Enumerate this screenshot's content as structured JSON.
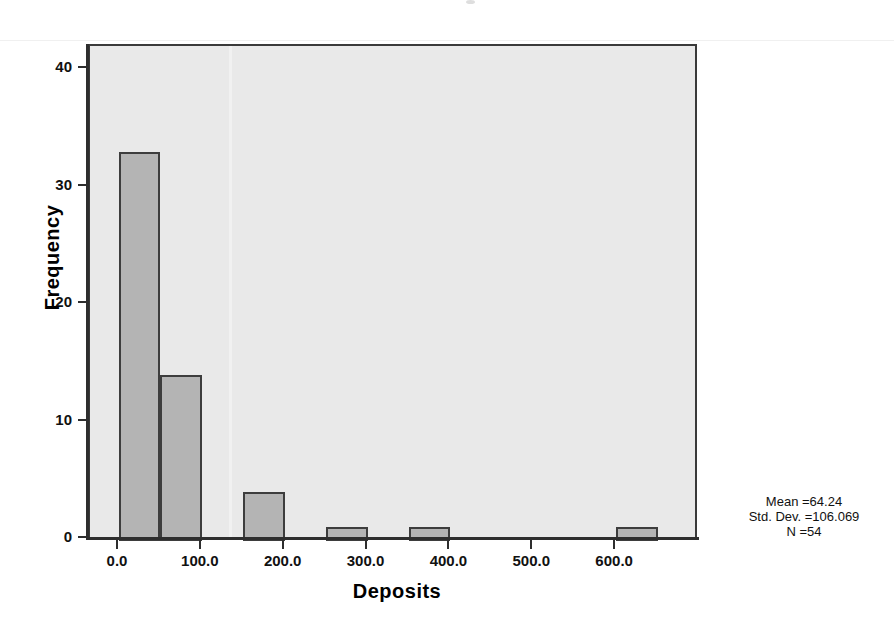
{
  "chart_data": {
    "type": "bar",
    "title": "",
    "subtitle": "",
    "xlabel": "Deposits",
    "ylabel": "Frequency",
    "xlim": [
      -35,
      700
    ],
    "ylim": [
      0,
      42
    ],
    "grid": false,
    "legend": "none",
    "bin_width": 50,
    "x_tick_labels": [
      "0.0",
      "100.0",
      "200.0",
      "300.0",
      "400.0",
      "500.0",
      "600.0"
    ],
    "x_tick_values": [
      0,
      100,
      200,
      300,
      400,
      500,
      600
    ],
    "y_tick_labels": [
      "0",
      "10",
      "20",
      "30",
      "40"
    ],
    "y_tick_values": [
      0,
      10,
      20,
      30,
      40
    ],
    "bins": [
      {
        "start": 0,
        "end": 50,
        "count": 33
      },
      {
        "start": 50,
        "end": 100,
        "count": 14
      },
      {
        "start": 100,
        "end": 150,
        "count": 0
      },
      {
        "start": 150,
        "end": 200,
        "count": 4
      },
      {
        "start": 200,
        "end": 250,
        "count": 0
      },
      {
        "start": 250,
        "end": 300,
        "count": 1
      },
      {
        "start": 300,
        "end": 350,
        "count": 0
      },
      {
        "start": 350,
        "end": 400,
        "count": 1
      },
      {
        "start": 400,
        "end": 450,
        "count": 0
      },
      {
        "start": 450,
        "end": 500,
        "count": 0
      },
      {
        "start": 500,
        "end": 550,
        "count": 0
      },
      {
        "start": 550,
        "end": 600,
        "count": 0
      },
      {
        "start": 600,
        "end": 650,
        "count": 1
      }
    ],
    "annotations": {
      "mean": "Mean =64.24",
      "std_dev": "Std. Dev. =106.069",
      "n": "N =54"
    },
    "colors": {
      "bar_fill": "#b4b4b4",
      "bar_edge": "#3d3d3d",
      "panel_background": "#e9e9e9",
      "panel_border": "#3a3a3a",
      "page_background": "#ffffff",
      "text": "#111111"
    }
  }
}
